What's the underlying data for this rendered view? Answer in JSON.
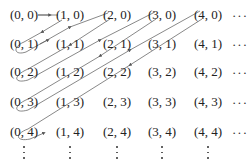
{
  "diagram": {
    "columns_x": [
      24,
      70,
      117,
      162,
      208
    ],
    "rows_y": [
      15,
      44,
      72,
      102,
      132
    ],
    "cells": [
      [
        "(0, 0)",
        "(1, 0)",
        "(2, 0)",
        "(3, 0)",
        "(4, 0)"
      ],
      [
        "(0, 1)",
        "(1, 1)",
        "(2, 1)",
        "(3, 1)",
        "(4, 1)"
      ],
      [
        "(0, 2)",
        "(1, 2)",
        "(2, 2)",
        "(3, 2)",
        "(4, 2)"
      ],
      [
        "(0, 3)",
        "(1, 3)",
        "(2, 3)",
        "(3, 3)",
        "(4, 3)"
      ],
      [
        "(0, 4)",
        "(1, 4)",
        "(2, 4)",
        "(3, 4)",
        "(4, 4)"
      ]
    ],
    "row_ellipsis": "···",
    "line_color": "#555555",
    "text_color": "#222222",
    "path_description": "Zig-zag diagonal path: (0,0)→(1,0)→(0,1)→(0,2)? no: (1,0) down-left to (0,1), loop to (2,0)... back to (0,2), loop to (3,0), back to (0,3), loop to (4,0), back to (0,4)"
  }
}
